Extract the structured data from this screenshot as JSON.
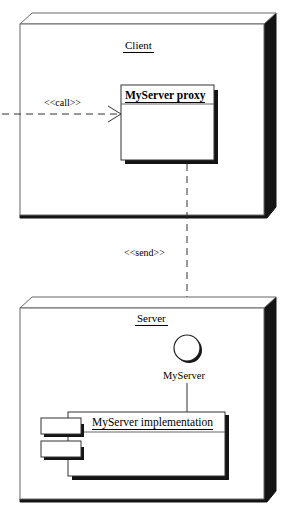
{
  "diagram": {
    "type": "uml-deployment-diagram",
    "colors": {
      "stroke": "#000000",
      "shadow": "#111111",
      "node_edge": "#555555",
      "background": "#ffffff"
    },
    "nodes": [
      {
        "id": "client",
        "name": "Client",
        "kind": "node-3d-box",
        "name_underlined": true
      },
      {
        "id": "server",
        "name": "Server",
        "kind": "node-3d-box",
        "name_underlined": true
      }
    ],
    "elements": {
      "proxy": {
        "name": "MyServer proxy",
        "kind": "class-box",
        "bold": true,
        "underlined": true
      },
      "interface": {
        "name": "MyServer",
        "kind": "lollipop-interface-circle"
      },
      "component": {
        "name": "MyServer implementation",
        "kind": "component-box",
        "underlined": true,
        "tabs": 2
      }
    },
    "connectors": [
      {
        "id": "call",
        "label": "<<call>>",
        "style": "dashed",
        "arrowhead": "open",
        "direction": "right",
        "from": "external",
        "to": "proxy"
      },
      {
        "id": "send",
        "label": "<<send>>",
        "style": "dashed",
        "arrowhead": "open",
        "direction": "down",
        "from": "proxy",
        "to": "interface"
      },
      {
        "id": "realization",
        "label": "",
        "style": "solid",
        "arrowhead": "none",
        "direction": "down",
        "from": "interface",
        "to": "component"
      }
    ]
  }
}
